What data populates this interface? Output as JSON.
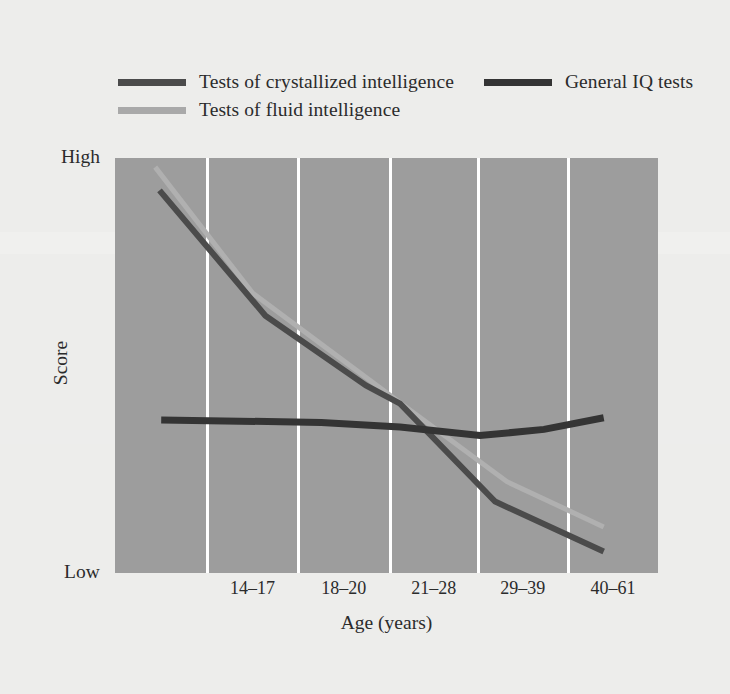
{
  "chart_data": {
    "type": "line",
    "title": "",
    "xlabel": "Age (years)",
    "ylabel": "Score",
    "categories": [
      "14–17",
      "18–20",
      "21–28",
      "29–39",
      "40–61"
    ],
    "ytick_labels": [
      "High",
      "Low"
    ],
    "ylim_labels": {
      "top": "High",
      "bottom": "Low"
    },
    "grid": "vertical-only",
    "legend_position": "above-plot",
    "plot_background": "#9d9d9d",
    "figure_background": "#ededeb",
    "series": [
      {
        "name": "Tests of crystallized intelligence",
        "color": "#4b4b4b",
        "width": 6,
        "points": [
          {
            "x": 0.082,
            "y": 0.078
          },
          {
            "x": 0.277,
            "y": 0.38
          },
          {
            "x": 0.462,
            "y": 0.548
          },
          {
            "x": 0.525,
            "y": 0.592
          },
          {
            "x": 0.7,
            "y": 0.828
          },
          {
            "x": 0.9,
            "y": 0.948
          }
        ]
      },
      {
        "name": "General IQ tests",
        "color": "#343434",
        "width": 7,
        "points": [
          {
            "x": 0.085,
            "y": 0.631
          },
          {
            "x": 0.38,
            "y": 0.637
          },
          {
            "x": 0.525,
            "y": 0.648
          },
          {
            "x": 0.672,
            "y": 0.669
          },
          {
            "x": 0.79,
            "y": 0.654
          },
          {
            "x": 0.9,
            "y": 0.626
          }
        ]
      },
      {
        "name": "Tests of fluid intelligence",
        "color": "#b0b0b0",
        "width": 5,
        "points": [
          {
            "x": 0.074,
            "y": 0.022
          },
          {
            "x": 0.253,
            "y": 0.325
          },
          {
            "x": 0.525,
            "y": 0.59
          },
          {
            "x": 0.722,
            "y": 0.78
          },
          {
            "x": 0.9,
            "y": 0.889
          }
        ]
      }
    ],
    "gridline_positions": [
      0.169,
      0.337,
      0.506,
      0.668,
      0.834
    ]
  },
  "legend": {
    "row1": [
      {
        "label": "Tests of crystallized intelligence",
        "color": "#4b4b4b"
      },
      {
        "label": "General IQ tests",
        "color": "#343434"
      }
    ],
    "row2": [
      {
        "label": "Tests of fluid intelligence",
        "color": "#a9a9a9"
      }
    ]
  },
  "axes": {
    "y_high": "High",
    "y_low": "Low",
    "y_title": "Score",
    "x_title": "Age (years)"
  }
}
